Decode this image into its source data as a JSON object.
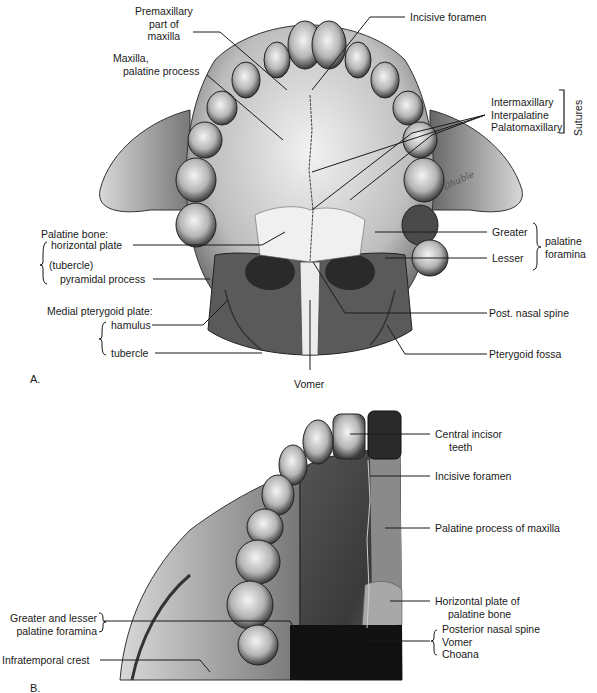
{
  "panel_a": {
    "letter": "A.",
    "labels": {
      "premaxillary_1": "Premaxillary",
      "premaxillary_2": "part of",
      "premaxillary_3": "maxilla",
      "maxilla_1": "Maxilla,",
      "maxilla_2": "palatine process",
      "incisive_foramen": "Incisive foramen",
      "intermaxillary": "Intermaxillary",
      "interpalatine": "Interpalatine",
      "palatomaxillary": "Palatomaxillary",
      "sutures": "Sutures",
      "palatine_bone": "Palatine bone:",
      "horizontal_plate": "horizontal plate",
      "tubercle_paren": "(tubercle)",
      "pyramidal_process": "pyramidal process",
      "medial_pterygoid_plate": "Medial pterygoid plate:",
      "hamulus": "hamulus",
      "tubercle": "tubercle",
      "greater": "Greater",
      "lesser": "Lesser",
      "palatine_foramina_1": "palatine",
      "palatine_foramina_2": "foramina",
      "post_nasal_spine": "Post. nasal spine",
      "pterygoid_fossa": "Pterygoid fossa",
      "vomer": "Vomer"
    }
  },
  "panel_b": {
    "letter": "B.",
    "labels": {
      "central_incisor_1": "Central incisor",
      "central_incisor_2": "teeth",
      "incisive_foramen": "Incisive foramen",
      "palatine_process": "Palatine process of maxilla",
      "horizontal_plate_1": "Horizontal plate of",
      "horizontal_plate_2": "palatine bone",
      "posterior_nasal_spine": "Posterior nasal spine",
      "vomer": "Vomer",
      "choana": "Choana",
      "greater_lesser_1": "Greater and lesser",
      "greater_lesser_2": "palatine foramina",
      "infratemporal_crest": "Infratemporal crest"
    }
  },
  "colors": {
    "ink": "#1a1a1a",
    "bone_light": "#e6e6e6",
    "bone_mid": "#9a9a9a",
    "bone_dark": "#2a2a2a",
    "background": "#ffffff"
  }
}
